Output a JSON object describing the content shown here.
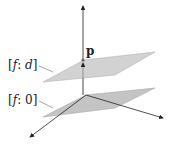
{
  "figure": {
    "point_label": "p",
    "upper_plane": {
      "label_prefix": "[",
      "label_f": "f",
      "label_sep": ": ",
      "label_val": "d",
      "label_suffix": "]"
    },
    "lower_plane": {
      "label_prefix": "[",
      "label_f": "f",
      "label_sep": ": ",
      "label_val": "0",
      "label_suffix": "]"
    },
    "colors": {
      "plane_fill": "#c8c8c8",
      "plane_edge": "#a0a0a0",
      "axis": "#222222"
    }
  }
}
